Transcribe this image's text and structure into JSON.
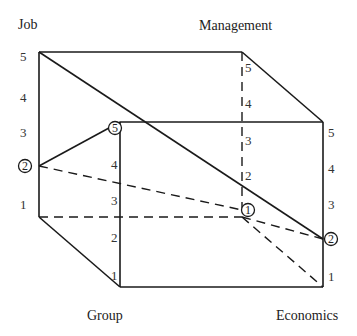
{
  "axes": {
    "job": "Job",
    "management": "Management",
    "group": "Group",
    "economics": "Economics"
  },
  "scale": [
    "1",
    "2",
    "3",
    "4",
    "5"
  ],
  "markers": {
    "job": "2",
    "group": "5",
    "management": "1",
    "economics": "2"
  }
}
